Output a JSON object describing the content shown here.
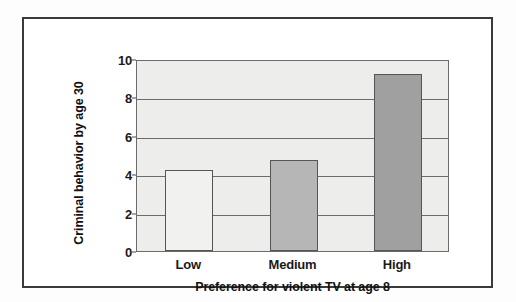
{
  "chart_data": {
    "type": "bar",
    "title": "",
    "subtitle": "",
    "categories": [
      "Low",
      "Medium",
      "High"
    ],
    "values": [
      4.2,
      4.75,
      9.2
    ],
    "series": [
      {
        "name": "Criminal behavior by age 30",
        "values": [
          4.2,
          4.75,
          9.2
        ]
      }
    ],
    "xlabel": "Preference for violent TV at age 8",
    "ylabel": "Criminal behavior by age 30",
    "ylim": [
      0,
      10
    ],
    "yticks": [
      0,
      2,
      4,
      6,
      8,
      10
    ],
    "ytick_labels": [
      "0",
      "2",
      "4",
      "6",
      "8",
      "10"
    ],
    "grid": true,
    "grid_axis": "y",
    "legend": false,
    "legend_position": "none",
    "bar_colors": [
      "#f1f1f0",
      "#b6b6b6",
      "#a0a0a0"
    ],
    "bar_edge_color": "#555555",
    "plot_background": "#ededeb",
    "frame_color": "#3a3a3a"
  },
  "axes": {
    "y_title": "Criminal behavior by age 30",
    "x_title": "Preference for violent TV at age 8",
    "y_tick_labels": [
      "10",
      "8",
      "6",
      "4",
      "2",
      "0"
    ],
    "x_tick_labels": [
      "Low",
      "Medium",
      "High"
    ]
  }
}
